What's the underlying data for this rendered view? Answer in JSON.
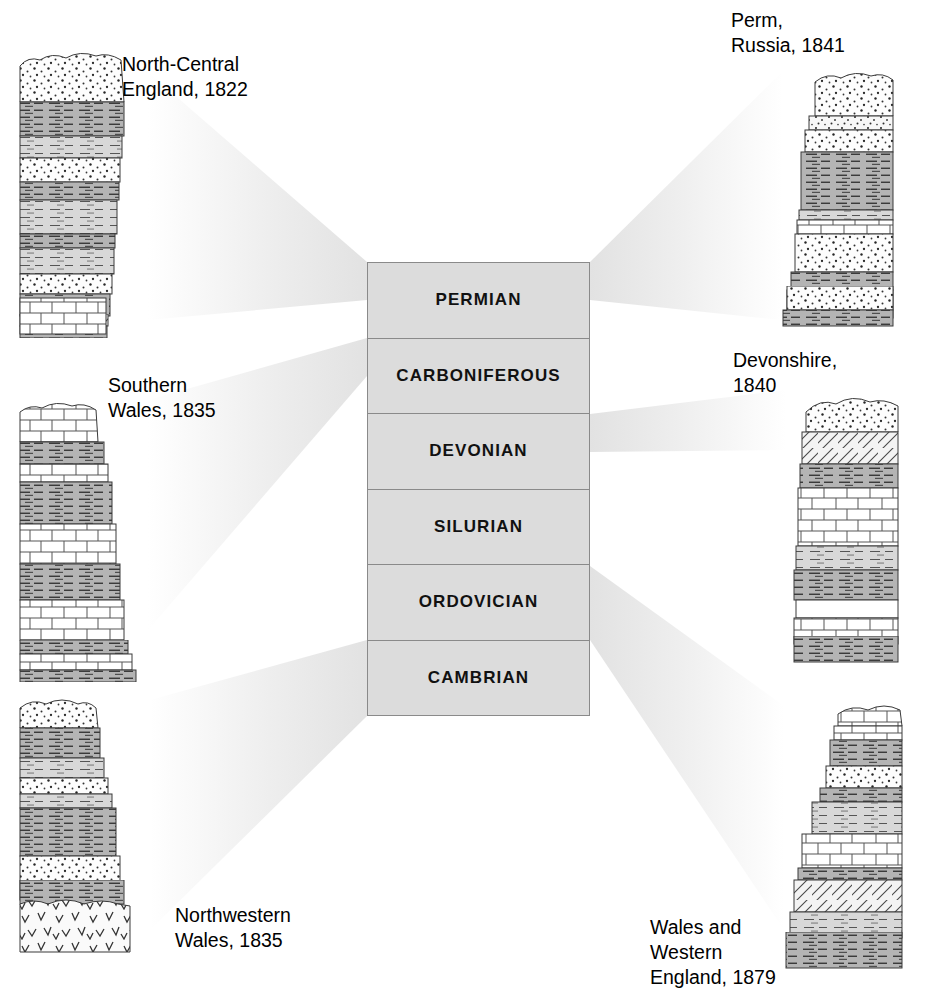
{
  "figure": {
    "background_color": "#ffffff"
  },
  "period_column": {
    "fill_color": "#dcdcdc",
    "border_color": "#8a8a8a",
    "periods": [
      {
        "name": "PERMIAN"
      },
      {
        "name": "CARBONIFEROUS"
      },
      {
        "name": "DEVONIAN"
      },
      {
        "name": "SILURIAN"
      },
      {
        "name": "ORDOVICIAN"
      },
      {
        "name": "CAMBRIAN"
      }
    ]
  },
  "localities": [
    {
      "id": "north-central-england",
      "label": "North-Central\nEngland, 1822",
      "period": "PERMIAN",
      "side": "left"
    },
    {
      "id": "perm-russia",
      "label": "Perm,\nRussia, 1841",
      "period": "PERMIAN",
      "side": "right"
    },
    {
      "id": "southern-wales",
      "label": "Southern\nWales, 1835",
      "period": "CARBONIFEROUS",
      "side": "left"
    },
    {
      "id": "devonshire",
      "label": "Devonshire,\n1840",
      "period": "DEVONIAN",
      "side": "right"
    },
    {
      "id": "northwestern-wales",
      "label": "Northwestern\nWales, 1835",
      "period": "CAMBRIAN",
      "side": "left"
    },
    {
      "id": "wales-western-england",
      "label": "Wales and\nWestern\nEngland, 1879",
      "period": "ORDOVICIAN",
      "side": "right"
    }
  ],
  "lithology_legend": [
    {
      "code": "sandstone",
      "pattern": "stippled dots",
      "fill": "#fdfdfd"
    },
    {
      "code": "shale",
      "pattern": "horizontal dashes",
      "fill": "#b6b6b6"
    },
    {
      "code": "siltstone",
      "pattern": "fine horizontal dashes",
      "fill": "#d6d6d6"
    },
    {
      "code": "limestone",
      "pattern": "brick / blocks",
      "fill": "#ffffff"
    },
    {
      "code": "schist",
      "pattern": "diagonal hatch",
      "fill": "#f2f2f2"
    },
    {
      "code": "volcanic",
      "pattern": "chevron v-marks",
      "fill": "#fafafa"
    }
  ],
  "connector_color": "#ededed"
}
